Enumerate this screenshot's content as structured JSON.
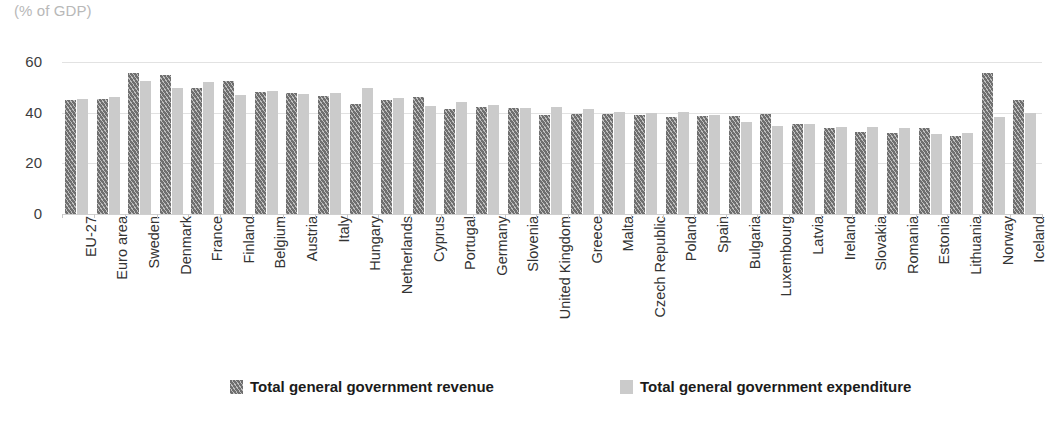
{
  "unit_label": "(% of GDP)",
  "legend": {
    "revenue_label": "Total general government revenue",
    "expenditure_label": "Total general government expenditure"
  },
  "axis": {
    "yticks": [
      "0",
      "20",
      "40",
      "60"
    ]
  },
  "colors": {
    "revenue": "#6f6f6f",
    "expenditure": "#cbcbcb",
    "gridline": "#e2e2e2",
    "unit_text": "#b8b8b8",
    "tick_text": "#333333"
  },
  "chart_data": {
    "type": "bar",
    "title": "",
    "subtitle": "",
    "xlabel": "",
    "ylabel": "(% of GDP)",
    "ylim": [
      0,
      60
    ],
    "yticks": [
      0,
      20,
      40,
      60
    ],
    "grid": true,
    "legend_position": "bottom",
    "categories": [
      "EU-27",
      "Euro area",
      "Sweden",
      "Denmark",
      "France",
      "Finland",
      "Belgium",
      "Austria",
      "Italy",
      "Hungary",
      "Netherlands",
      "Cyprus",
      "Portugal",
      "Germany",
      "Slovenia",
      "United Kingdom",
      "Greece",
      "Malta",
      "Czech Republic",
      "Poland",
      "Spain",
      "Bulgaria",
      "Luxembourg",
      "Latvia",
      "Ireland",
      "Slovakia",
      "Romania",
      "Estonia",
      "Lithuania",
      "Norway",
      "Iceland"
    ],
    "series": [
      {
        "name": "Total general government revenue",
        "values": [
          44.9,
          45.5,
          55.5,
          54.9,
          49.6,
          52.4,
          48.3,
          47.6,
          46.4,
          43.6,
          45.2,
          46.1,
          41.5,
          42.4,
          41.8,
          39.2,
          39.4,
          39.6,
          38.9,
          38.3,
          38.6,
          38.8,
          39.6,
          35.5,
          34.1,
          32.3,
          32.1,
          33.9,
          30.9,
          55.5,
          44.9
        ]
      },
      {
        "name": "Total general government expenditure",
        "values": [
          45.3,
          46.0,
          52.7,
          49.9,
          52.3,
          47.1,
          48.4,
          47.2,
          47.7,
          49.6,
          45.6,
          42.5,
          44.2,
          43.2,
          41.7,
          42.1,
          41.4,
          40.1,
          40.0,
          40.1,
          39.1,
          36.4,
          34.9,
          35.5,
          34.3,
          34.4,
          34.0,
          31.6,
          32.1,
          38.2,
          40.0
        ]
      }
    ]
  }
}
